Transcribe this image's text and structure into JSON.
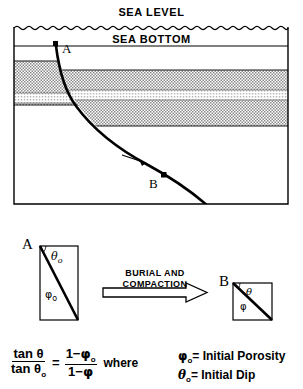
{
  "figure": {
    "title_labels": {
      "sea_level": "SEA LEVEL",
      "sea_bottom": "SEA BOTTOM"
    },
    "cross_section": {
      "point_a_label": "A",
      "point_b_label": "B",
      "frame": {
        "left": 14,
        "top": 26,
        "right": 288,
        "bottom": 204
      },
      "sea_bottom_line_y": 46,
      "fault_curve": "A at top-left steepening listric fault curving down to the right through B",
      "strata": {
        "left_block": {
          "top": 61,
          "bottom": 105,
          "marker_band_top": 93,
          "marker_band_bottom": 103
        },
        "right_block": {
          "top": 70,
          "bottom": 126,
          "marker_band_top": 90,
          "marker_band_bottom": 100
        }
      },
      "slip_arrow": "down-dip arrow on fault between A and B"
    },
    "box_a": {
      "label": "A",
      "angle_top_label": "θ",
      "angle_top_sub": "o",
      "angle_bottom_label": "φ",
      "angle_bottom_sub": "o"
    },
    "box_b": {
      "label": "B",
      "angle_top_label": "θ",
      "angle_bottom_label": "φ"
    },
    "process_arrow": {
      "line1": "BURIAL  AND",
      "line2": "COMPACTION"
    },
    "equation": {
      "numerator_left": "tan θ",
      "denominator_left": "tan θ",
      "denominator_left_sub": "o",
      "equals": "=",
      "numerator_right_prefix": "1−",
      "numerator_right_sym": "φ",
      "numerator_right_sub": "o",
      "denominator_right_prefix": "1−",
      "denominator_right_sym": "φ",
      "where": "where"
    },
    "definitions": [
      {
        "symbol": "φ",
        "sub": "o",
        "equals": "=",
        "text": "Initial Porosity"
      },
      {
        "symbol": "θ",
        "sub": "o",
        "equals": "=",
        "text": "Initial Dip"
      }
    ],
    "colors": {
      "ink": "#000000",
      "background": "#ffffff",
      "stipple": "#9a9a9a",
      "stipple_light": "#c8c8c8"
    }
  }
}
